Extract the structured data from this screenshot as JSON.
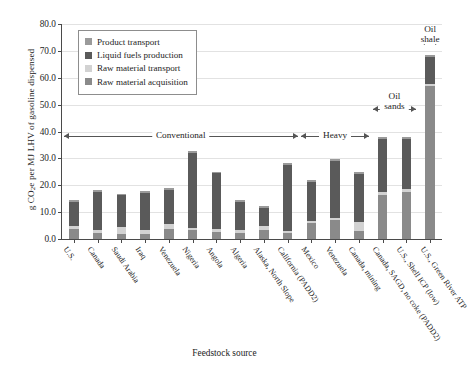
{
  "axes": {
    "ylabel_main": "g CO",
    "ylabel_sub": "2",
    "ylabel_rest": "e per MJ LHV of gasoline dispensed",
    "ylabel_full": "g CO2e per MJ LHV of gasoline dispensed",
    "xlabel": "Feedstock source",
    "yticks": [
      "0.0",
      "10.0",
      "20.0",
      "30.0",
      "40.0",
      "50.0",
      "60.0",
      "70.0",
      "80.0"
    ],
    "ymin": 0,
    "ymax": 80
  },
  "legend": {
    "items": [
      {
        "label": "Product transport",
        "color": "#9a9a9a"
      },
      {
        "label": "Liquid fuels production",
        "color": "#5a5a5a"
      },
      {
        "label": "Raw material transport",
        "color": "#d2d2d2"
      },
      {
        "label": "Raw material acquisition",
        "color": "#8a8a8a"
      }
    ]
  },
  "annotations": [
    {
      "text": "Conventional",
      "lines": [
        "Conventional"
      ],
      "from": 0,
      "to": 9,
      "level": 0
    },
    {
      "text": "Heavy",
      "lines": [
        "Heavy"
      ],
      "from": 10,
      "to": 12,
      "level": 0
    },
    {
      "text": "Oil sands",
      "lines": [
        "Oil",
        "sands"
      ],
      "from": 13,
      "to": 14,
      "level": 1
    },
    {
      "text": "Oil shale",
      "lines": [
        "Oil",
        "shale"
      ],
      "from": 15,
      "to": 15,
      "level": 2
    }
  ],
  "chart_data": {
    "type": "bar",
    "stacked": true,
    "title": "",
    "xlabel": "Feedstock source",
    "ylabel": "g CO2e per MJ LHV of gasoline dispensed",
    "ylim": [
      0,
      80
    ],
    "yticks": [
      0,
      10,
      20,
      30,
      40,
      50,
      60,
      70,
      80
    ],
    "grid": true,
    "legend_position": "upper-left-inside",
    "categories": [
      "U.S.",
      "Canada",
      "Saudi Arabia",
      "Iraq",
      "Venezuela",
      "Nigeria",
      "Angola",
      "Algeria",
      "Alaska, North Slope",
      "California (PADD2)",
      "Mexico",
      "Venezuela",
      "Canada, mining",
      "Canada, SAGD, no coke (PADD2)",
      "U.S., Shell ICP (low)",
      "U.S., Green River ATP"
    ],
    "series": [
      {
        "name": "Raw material acquisition",
        "color": "#8a8a8a",
        "values": [
          3.8,
          2.3,
          1.9,
          2.0,
          3.9,
          3.3,
          2.6,
          2.2,
          3.3,
          2.3,
          5.9,
          7.0,
          2.9,
          16.5,
          17.4,
          56.8
        ]
      },
      {
        "name": "Raw material transport",
        "color": "#d2d2d2",
        "values": [
          0.9,
          1.0,
          2.6,
          1.5,
          1.6,
          0.8,
          1.0,
          1.0,
          1.6,
          0.7,
          0.9,
          0.9,
          3.4,
          0.9,
          1.4,
          0.7
        ]
      },
      {
        "name": "Liquid fuels production",
        "color": "#5a5a5a",
        "values": [
          9.1,
          14.3,
          11.7,
          13.6,
          12.7,
          27.8,
          20.8,
          10.6,
          6.7,
          24.5,
          14.6,
          21.3,
          18.0,
          19.8,
          18.4,
          10.3
        ]
      },
      {
        "name": "Product transport",
        "color": "#9a9a9a",
        "values": [
          0.7,
          0.7,
          0.7,
          0.7,
          0.7,
          1.0,
          0.7,
          0.7,
          0.7,
          0.7,
          0.7,
          0.7,
          0.7,
          0.7,
          0.7,
          0.7
        ]
      }
    ],
    "totals": [
      14.5,
      18.3,
      16.9,
      17.8,
      18.9,
      32.9,
      25.1,
      14.5,
      12.3,
      28.2,
      22.1,
      29.9,
      25.0,
      37.9,
      37.9,
      68.5
    ],
    "group_annotations": [
      {
        "label": "Conventional",
        "categories": [
          "U.S.",
          "Canada",
          "Saudi Arabia",
          "Iraq",
          "Venezuela",
          "Nigeria",
          "Angola",
          "Algeria",
          "Alaska, North Slope",
          "California (PADD2)"
        ]
      },
      {
        "label": "Heavy",
        "categories": [
          "Mexico",
          "Venezuela",
          "Canada, mining"
        ]
      },
      {
        "label": "Oil sands",
        "categories": [
          "Canada, SAGD, no coke (PADD2)",
          "U.S., Shell ICP (low)"
        ]
      },
      {
        "label": "Oil shale",
        "categories": [
          "U.S., Green River ATP"
        ]
      }
    ]
  }
}
